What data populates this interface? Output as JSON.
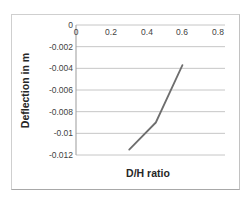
{
  "chart_data": {
    "type": "line",
    "title": "",
    "xlabel": "D/H ratio",
    "ylabel": "Deflection in m",
    "x": [
      0.3,
      0.45,
      0.6
    ],
    "series": [
      {
        "name": "Deflection",
        "values": [
          -0.0115,
          -0.009,
          -0.0037
        ]
      }
    ],
    "xlim": [
      0,
      0.84
    ],
    "ylim": [
      -0.012,
      0
    ],
    "x_ticks": {
      "values": [
        0,
        0.2,
        0.4,
        0.6,
        0.8
      ],
      "labels": [
        "0",
        "0.2",
        "0.4",
        "0.6",
        "0.8"
      ]
    },
    "y_ticks": {
      "values": [
        0,
        -0.002,
        -0.004,
        -0.006,
        -0.008,
        -0.01,
        -0.012
      ],
      "labels": [
        "0",
        "-0.002",
        "-0.004",
        "-0.006",
        "-0.008",
        "-0.01",
        "-0.012"
      ]
    },
    "grid": "horizontal",
    "legend": "none",
    "colors": {
      "series_line": "#6e6e6e",
      "gridline": "#c6c6c6",
      "axis_line": "#9b9b9b",
      "tick_text": "#3f3f3f",
      "title_text": "#262626",
      "chart_border": "#cfcfcf",
      "background": "#ffffff"
    }
  }
}
